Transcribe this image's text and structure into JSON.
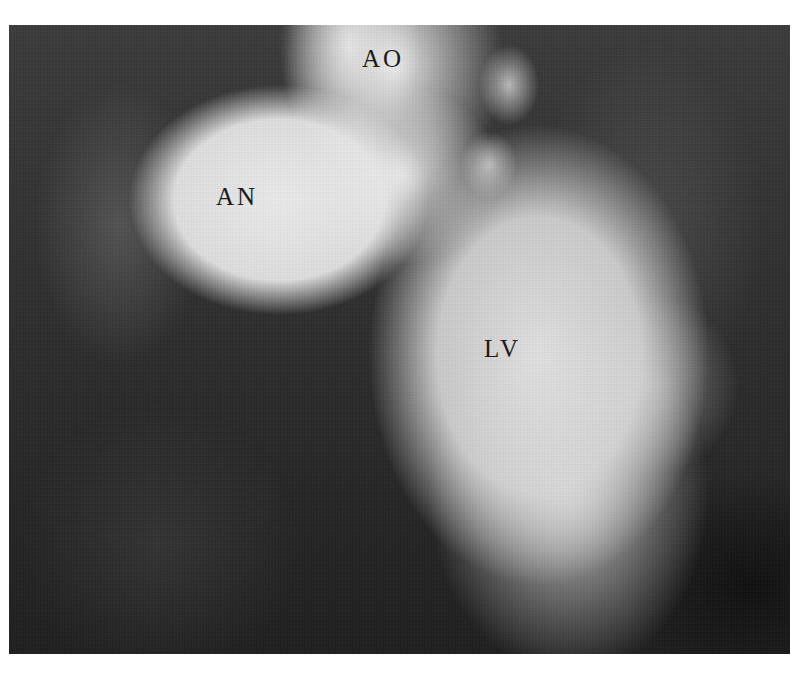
{
  "image": {
    "type": "angiogram",
    "background_color": "#ffffff",
    "frame": {
      "x": 9,
      "y": 25,
      "width": 781,
      "height": 629
    }
  },
  "labels": {
    "aorta": "AO",
    "aneurysm": "AN",
    "left_ventricle": "LV"
  }
}
